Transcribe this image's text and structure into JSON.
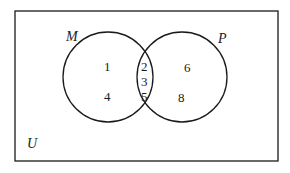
{
  "diagram": {
    "type": "venn",
    "universe_label": "U",
    "sets": [
      {
        "label": "M",
        "only": [
          "1",
          "4"
        ]
      },
      {
        "label": "P",
        "only": [
          "6",
          "8"
        ]
      }
    ],
    "intersection": [
      "2",
      "3",
      "5"
    ],
    "colors": {
      "stroke": "#1a1a1a",
      "background": "#ffffff"
    }
  }
}
